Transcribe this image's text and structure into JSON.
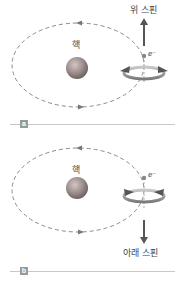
{
  "panel_a": {
    "tag": "a",
    "nucleus_label": "핵",
    "spin_label": "위 스핀",
    "electron_label": "e⁻",
    "spin_direction": "up"
  },
  "panel_b": {
    "tag": "b",
    "nucleus_label": "핵",
    "spin_label": "아래 스핀",
    "electron_label": "e⁻",
    "spin_direction": "down"
  },
  "colors": {
    "orbit": "#8a8a8a",
    "nucleus": "#9c8c8c",
    "arrow": "#555555",
    "tag_bg": "#9a9a9a",
    "divider": "#c8c8c8"
  }
}
